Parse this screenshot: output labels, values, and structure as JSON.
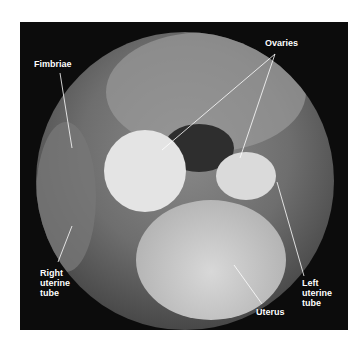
{
  "figure": {
    "labels": {
      "ovaries": "Ovaries",
      "fimbriae": "Fimbriae",
      "right_uterine_tube": [
        "Right",
        "uterine",
        "tube"
      ],
      "left_uterine_tube": [
        "Left",
        "uterine",
        "tube"
      ],
      "uterus": "Uterus"
    }
  }
}
